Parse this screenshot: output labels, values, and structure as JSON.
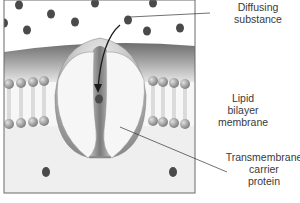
{
  "diagram": {
    "labels": {
      "diffusing_line1": "Diffusing",
      "diffusing_line2": "substance",
      "lipid_line1": "Lipid",
      "lipid_line2": "bilayer",
      "lipid_line3": "membrane",
      "carrier_line1": "Transmembrane",
      "carrier_line2": "carrier",
      "carrier_line3": "protein"
    },
    "colors": {
      "molecule": "#4a4a4a",
      "membrane_dark": "#8a8a8a",
      "membrane_light": "#d8d8d8",
      "lipid_head": "#9a9a9a",
      "protein_fill": "#f4f4f4",
      "channel": "#8c8c8c",
      "frame": "#6a6a6a",
      "text": "#3a3a3a"
    }
  }
}
